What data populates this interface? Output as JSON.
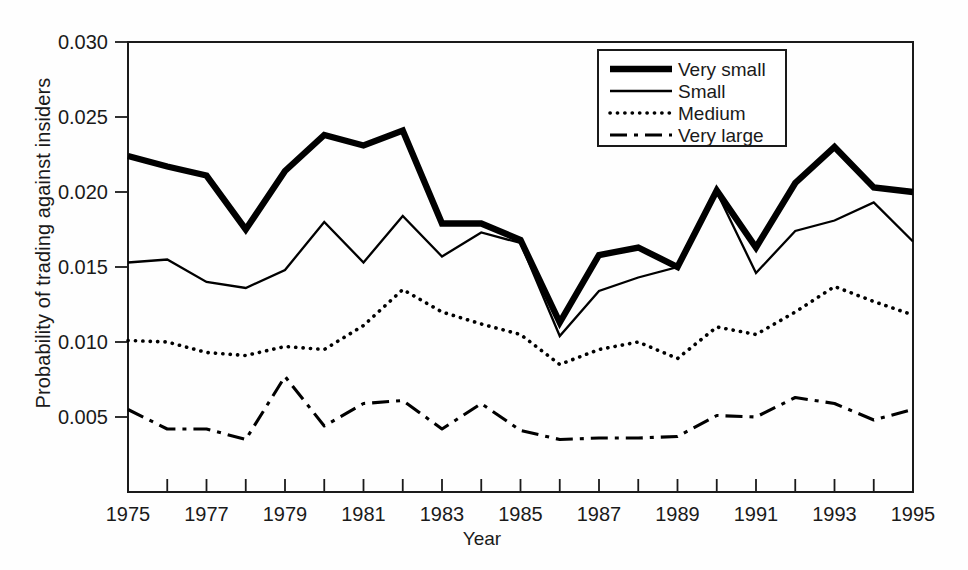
{
  "chart_data": {
    "type": "line",
    "title": "",
    "xlabel": "Year",
    "ylabel": "Probability of trading against insiders",
    "xlim": [
      1975,
      1995
    ],
    "ylim": [
      0.0,
      0.03
    ],
    "grid": false,
    "legend_position": "top-right",
    "x": [
      1975,
      1976,
      1977,
      1978,
      1979,
      1980,
      1981,
      1982,
      1983,
      1984,
      1985,
      1986,
      1987,
      1988,
      1989,
      1990,
      1991,
      1992,
      1993,
      1994,
      1995
    ],
    "xtick_labels": [
      "1975",
      "1977",
      "1979",
      "1981",
      "1983",
      "1985",
      "1987",
      "1989",
      "1991",
      "1993",
      "1995"
    ],
    "xtick_values": [
      1975,
      1977,
      1979,
      1981,
      1983,
      1985,
      1987,
      1989,
      1991,
      1993,
      1995
    ],
    "xminor_every": 1,
    "ytick_labels": [
      "0.030",
      "0.025",
      "0.020",
      "0.015",
      "0.010",
      "0.005"
    ],
    "ytick_values": [
      0.03,
      0.025,
      0.02,
      0.015,
      0.01,
      0.005
    ],
    "series": [
      {
        "name": "Very small",
        "style": "thick-solid",
        "color": "#000000",
        "values": [
          0.0224,
          0.0217,
          0.0211,
          0.0175,
          0.0214,
          0.0238,
          0.0231,
          0.0241,
          0.0179,
          0.0179,
          0.0168,
          0.0113,
          0.0158,
          0.0163,
          0.015,
          0.0201,
          0.0163,
          0.0206,
          0.023,
          0.0203,
          0.02
        ]
      },
      {
        "name": "Small",
        "style": "thin-solid",
        "color": "#000000",
        "values": [
          0.0153,
          0.0155,
          0.014,
          0.0136,
          0.0148,
          0.018,
          0.0153,
          0.0184,
          0.0157,
          0.0173,
          0.0166,
          0.0104,
          0.0134,
          0.0143,
          0.015,
          0.02,
          0.0146,
          0.0174,
          0.0181,
          0.0193,
          0.0167
        ]
      },
      {
        "name": "Medium",
        "style": "dotted",
        "color": "#000000",
        "values": [
          0.0101,
          0.01,
          0.0093,
          0.0091,
          0.0097,
          0.0095,
          0.0111,
          0.0135,
          0.012,
          0.0112,
          0.0105,
          0.0085,
          0.0095,
          0.01,
          0.0089,
          0.011,
          0.0105,
          0.012,
          0.0137,
          0.0127,
          0.0118
        ]
      },
      {
        "name": "Very large",
        "style": "dash-dot",
        "color": "#000000",
        "values": [
          0.0055,
          0.0042,
          0.0042,
          0.0035,
          0.0077,
          0.0044,
          0.0059,
          0.0061,
          0.0042,
          0.0059,
          0.0041,
          0.0035,
          0.0036,
          0.0036,
          0.0037,
          0.0051,
          0.005,
          0.0063,
          0.0059,
          0.0048,
          0.0055
        ]
      }
    ]
  },
  "axis": {
    "y_title": "Probability of trading against insiders",
    "x_title": "Year"
  },
  "legend": {
    "entries": [
      {
        "label": "Very small"
      },
      {
        "label": "Small"
      },
      {
        "label": "Medium"
      },
      {
        "label": "Very large"
      }
    ]
  }
}
